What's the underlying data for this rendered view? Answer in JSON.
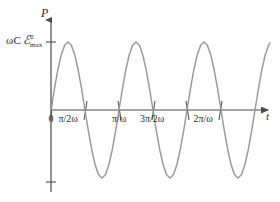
{
  "figure": {
    "background_color": "#ffffff",
    "curve_color": "#9b9b9b",
    "axis_color": "#4a4a4a",
    "text_color": "#2b2b2b"
  },
  "axes": {
    "y_axis_label": "P",
    "x_axis_label": "t",
    "origin_label": "0"
  },
  "y_ticks": [
    {
      "label": "ωC ℰ²max",
      "value": 1
    }
  ],
  "x_ticks": [
    {
      "label": "0",
      "value": 0
    },
    {
      "label": "π/2ω",
      "value": 0.5
    },
    {
      "label": "π/ω",
      "value": 1
    },
    {
      "label": "3π/2ω",
      "value": 1.5
    },
    {
      "label": "2π/ω",
      "value": 2
    }
  ],
  "chart_data": {
    "type": "line",
    "title": "",
    "xlabel": "t",
    "ylabel": "P",
    "grid": false,
    "legend": null,
    "xlim": [
      0,
      3.25
    ],
    "ylim": [
      -1.05,
      1.05
    ],
    "xtick_labels": [
      "0",
      "π/2ω",
      "π/ω",
      "3π/2ω",
      "2π/ω"
    ],
    "xtick_values": [
      0,
      0.5,
      1,
      1.5,
      2
    ],
    "ytick_labels": [
      "ωC ℰ²max"
    ],
    "ytick_values": [
      1
    ],
    "annotations": [
      "Instantaneous power P = ωC ℰ²max · sin(2ωt) oscillates symmetrically about zero",
      "Curve is drawn from t = 0 to just past t = 3π/ω, ending mid-rise after the third trough"
    ],
    "series": [
      {
        "name": "P(t)",
        "color": "#9b9b9b",
        "form": "amplitude * sin(2*pi*x)",
        "amplitude": 1,
        "period_in_x_units": 1,
        "x_start": 0,
        "x_end": 3.22,
        "x": [
          0,
          0.05,
          0.1,
          0.15,
          0.2,
          0.25,
          0.3,
          0.35,
          0.4,
          0.45,
          0.5,
          0.55,
          0.6,
          0.65,
          0.7,
          0.75,
          0.8,
          0.85,
          0.9,
          0.95,
          1,
          1.05,
          1.1,
          1.15,
          1.2,
          1.25,
          1.3,
          1.35,
          1.4,
          1.45,
          1.5,
          1.55,
          1.6,
          1.65,
          1.7,
          1.75,
          1.8,
          1.85,
          1.9,
          1.95,
          2,
          2.05,
          2.1,
          2.15,
          2.2,
          2.25,
          2.3,
          2.35,
          2.4,
          2.45,
          2.5,
          2.55,
          2.6,
          2.65,
          2.7,
          2.75,
          2.8,
          2.85,
          2.9,
          2.95,
          3,
          3.05,
          3.1,
          3.15,
          3.2,
          3.22
        ],
        "y": [
          0,
          0.309,
          0.588,
          0.809,
          0.951,
          1,
          0.951,
          0.809,
          0.588,
          0.309,
          0,
          -0.309,
          -0.588,
          -0.809,
          -0.951,
          -1,
          -0.951,
          -0.809,
          -0.588,
          -0.309,
          0,
          0.309,
          0.588,
          0.809,
          0.951,
          1,
          0.951,
          0.809,
          0.588,
          0.309,
          0,
          -0.309,
          -0.588,
          -0.809,
          -0.951,
          -1,
          -0.951,
          -0.809,
          -0.588,
          -0.309,
          0,
          0.309,
          0.588,
          0.809,
          0.951,
          1,
          0.951,
          0.809,
          0.588,
          0.309,
          0,
          -0.309,
          -0.588,
          -0.809,
          -0.951,
          -1,
          -0.951,
          -0.809,
          -0.588,
          -0.309,
          0,
          0.309,
          0.588,
          0.809,
          0.951,
          0.988
        ]
      }
    ]
  }
}
